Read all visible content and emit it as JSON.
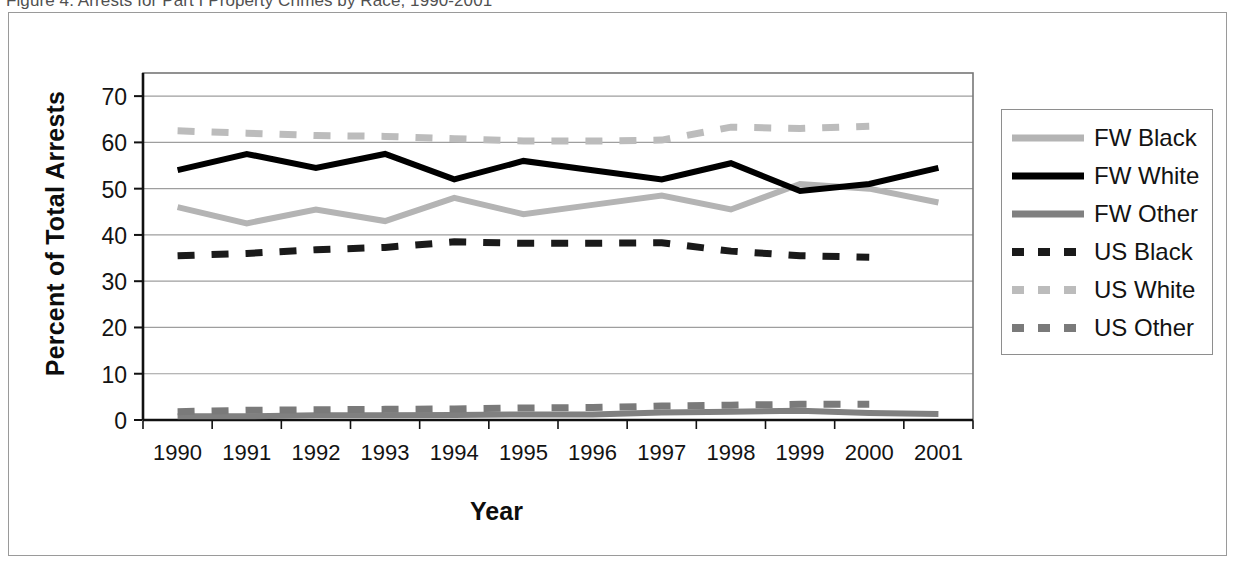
{
  "caption": {
    "text": "Figure 4.  Arrests for Part I Property Crimes by Race, 1990-2001"
  },
  "chart_data": {
    "type": "line",
    "title": "",
    "xlabel": "Year",
    "ylabel": "Percent of Total Arrests",
    "categories": [
      "1990",
      "1991",
      "1992",
      "1993",
      "1994",
      "1995",
      "1996",
      "1997",
      "1998",
      "1999",
      "2000",
      "2001"
    ],
    "ylim": [
      0,
      75
    ],
    "yticks": [
      0,
      10,
      20,
      30,
      40,
      50,
      60,
      70
    ],
    "grid": true,
    "legend_position": "right",
    "series": [
      {
        "name": "FW Black",
        "style": "solid",
        "color": "#b4b4b4",
        "width": 6,
        "values": [
          46.0,
          42.5,
          45.5,
          43.0,
          48.0,
          44.5,
          46.5,
          48.5,
          45.5,
          51.0,
          50.0,
          47.0
        ]
      },
      {
        "name": "FW White",
        "style": "solid",
        "color": "#000000",
        "width": 6,
        "values": [
          54.0,
          57.5,
          54.5,
          57.5,
          52.0,
          56.0,
          54.0,
          52.0,
          55.5,
          49.5,
          51.0,
          54.5
        ]
      },
      {
        "name": "FW Other",
        "style": "solid",
        "color": "#808080",
        "width": 6,
        "values": [
          0.8,
          0.8,
          1.0,
          1.0,
          1.1,
          1.2,
          1.2,
          1.6,
          1.8,
          2.0,
          1.5,
          1.3
        ]
      },
      {
        "name": "US Black",
        "style": "dashed",
        "color": "#1a1a1a",
        "width": 7,
        "values": [
          35.5,
          36.0,
          36.8,
          37.3,
          38.5,
          38.2,
          38.2,
          38.3,
          36.5,
          35.5,
          35.2,
          null
        ]
      },
      {
        "name": "US White",
        "style": "dashed",
        "color": "#bcbcbc",
        "width": 7,
        "values": [
          62.5,
          62.0,
          61.5,
          61.3,
          60.8,
          60.3,
          60.3,
          60.5,
          63.3,
          63.0,
          63.5,
          null
        ]
      },
      {
        "name": "US Other",
        "style": "dashed",
        "color": "#7a7a7a",
        "width": 7,
        "values": [
          1.8,
          2.1,
          2.2,
          2.3,
          2.4,
          2.6,
          2.7,
          3.0,
          3.2,
          3.4,
          3.4,
          null
        ]
      }
    ]
  },
  "legend": {
    "items": [
      {
        "label": "FW Black"
      },
      {
        "label": "FW White"
      },
      {
        "label": "FW Other"
      },
      {
        "label": "US Black"
      },
      {
        "label": "US White"
      },
      {
        "label": "US Other"
      }
    ]
  }
}
